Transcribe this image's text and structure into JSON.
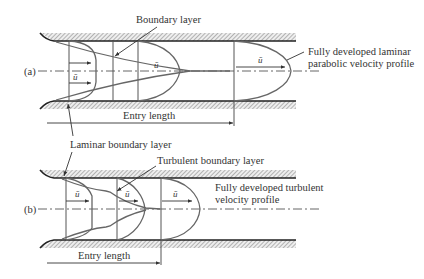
{
  "figure": {
    "panel_a": {
      "tag": "(a)",
      "labels": {
        "boundary_layer": "Boundary layer",
        "fully_developed_line1": "Fully developed laminar",
        "fully_developed_line2": "parabolic velocity profile",
        "entry_length": "Entry length",
        "laminar_boundary_layer": "Laminar boundary layer",
        "u_bar": "ū"
      }
    },
    "panel_b": {
      "tag": "(b)",
      "labels": {
        "turbulent_boundary_layer": "Turbulent boundary layer",
        "fully_developed_line1": "Fully developed turbulent",
        "fully_developed_line2": "velocity profile",
        "entry_length": "Entry length",
        "u_bar": "ū"
      }
    }
  },
  "colors": {
    "wall": "#222222",
    "profile": "#666666",
    "text": "#333333",
    "background": "#ffffff"
  }
}
